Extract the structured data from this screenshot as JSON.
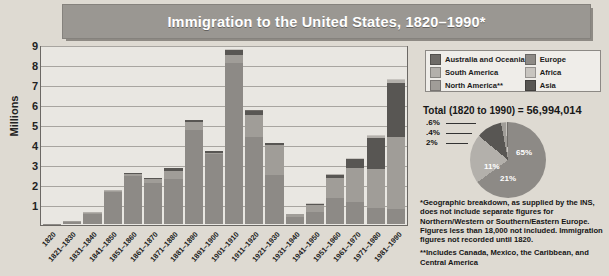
{
  "title": "Immigration to the United States, 1820–1990*",
  "axis": {
    "ylabel": "Millions",
    "yticks": [
      "9",
      "8",
      "7",
      "6",
      "5",
      "4",
      "3",
      "2",
      "1"
    ],
    "ymax": 9
  },
  "legend": {
    "items": [
      {
        "label": "Australia and Oceania",
        "color": "#6f6c68",
        "key": "oceania"
      },
      {
        "label": "Europe",
        "color": "#8d8a86",
        "key": "europe"
      },
      {
        "label": "South America",
        "color": "#b3b0ab",
        "key": "south_america"
      },
      {
        "label": "Africa",
        "color": "#c8c5c0",
        "key": "africa"
      },
      {
        "label": "North America**",
        "color": "#a09d98",
        "key": "north_america"
      },
      {
        "label": "Asia",
        "color": "#585653",
        "key": "asia"
      }
    ]
  },
  "total": {
    "prefix": "Total (1820 to 1990) = ",
    "value": "56,994,014"
  },
  "notes": [
    "*Geographic breakdown, as supplied by the INS, does not include separate figures for Northern/Western or Southern/Eastern Europe. Figures less than 18,000 not included. Immigration figures not recorded until 1820.",
    "**Includes Canada, Mexico, the Caribbean, and Central America"
  ],
  "chart_data": {
    "type": "bar",
    "title": "Immigration to the United States, 1820–1990*",
    "xlabel": "",
    "ylabel": "Millions",
    "ylim": [
      0,
      9
    ],
    "grid": true,
    "stacked": true,
    "legend_position": "top-right",
    "categories": [
      "1820",
      "1821–1830",
      "1831–1840",
      "1841–1850",
      "1851–1860",
      "1861–1870",
      "1871–1880",
      "1881–1890",
      "1891–1900",
      "1901–1910",
      "1911–1920",
      "1921–1930",
      "1931–1940",
      "1941–1950",
      "1951–1960",
      "1961–1970",
      "1971–1980",
      "1981–1990"
    ],
    "totals": [
      0.01,
      0.15,
      0.6,
      1.71,
      2.6,
      2.31,
      2.81,
      5.25,
      3.69,
      8.8,
      5.74,
      4.11,
      0.53,
      1.04,
      2.52,
      3.32,
      4.49,
      7.34
    ],
    "series": [
      {
        "name": "Europe",
        "values": [
          0.008,
          0.1,
          0.5,
          1.6,
          2.45,
          2.06,
          2.27,
          4.74,
          3.56,
          8.14,
          4.38,
          2.48,
          0.35,
          0.62,
          1.33,
          1.13,
          0.8,
          0.76
        ]
      },
      {
        "name": "North America**",
        "values": [
          0.002,
          0.04,
          0.08,
          0.08,
          0.1,
          0.2,
          0.42,
          0.43,
          0.04,
          0.42,
          1.14,
          1.52,
          0.16,
          0.35,
          0.99,
          1.72,
          1.98,
          3.62
        ]
      },
      {
        "name": "Asia",
        "values": [
          0.0,
          0.0,
          0.0,
          0.0,
          0.04,
          0.06,
          0.12,
          0.07,
          0.07,
          0.25,
          0.19,
          0.1,
          0.02,
          0.04,
          0.15,
          0.43,
          1.59,
          2.74
        ]
      },
      {
        "name": "South America",
        "values": [
          0.0,
          0.01,
          0.01,
          0.02,
          0.01,
          0.01,
          0.01,
          0.01,
          0.01,
          0.01,
          0.02,
          0.01,
          0.0,
          0.02,
          0.04,
          0.03,
          0.08,
          0.14
        ]
      },
      {
        "name": "Africa",
        "values": [
          0.0,
          0.0,
          0.0,
          0.0,
          0.0,
          0.0,
          0.0,
          0.0,
          0.0,
          0.01,
          0.01,
          0.0,
          0.0,
          0.01,
          0.01,
          0.01,
          0.03,
          0.08
        ]
      },
      {
        "name": "Australia and Oceania",
        "values": [
          0.0,
          0.0,
          0.01,
          0.01,
          0.0,
          0.0,
          0.01,
          0.0,
          0.01,
          0.01,
          0.01,
          0.0,
          0.0,
          0.0,
          0.0,
          0.0,
          0.01,
          0.0
        ]
      }
    ]
  },
  "pie_data": {
    "type": "pie",
    "title": "Total (1820 to 1990) = 56,994,014",
    "slices": [
      {
        "label": "65%",
        "value": 65,
        "name": "Europe",
        "color": "#8d8a86",
        "inside": true
      },
      {
        "label": "21%",
        "value": 21,
        "name": "North America**",
        "color": "#b3b0ab",
        "inside": true
      },
      {
        "label": "11%",
        "value": 11,
        "name": "Asia",
        "color": "#585653",
        "inside": true
      },
      {
        "label": "2%",
        "value": 2,
        "name": "South America",
        "color": "#a09d98",
        "inside": false
      },
      {
        "label": ".4%",
        "value": 0.4,
        "name": "Africa",
        "color": "#c8c5c0",
        "inside": false
      },
      {
        "label": ".6%",
        "value": 0.6,
        "name": "Australia and Oceania",
        "color": "#6f6c68",
        "inside": false
      }
    ]
  }
}
